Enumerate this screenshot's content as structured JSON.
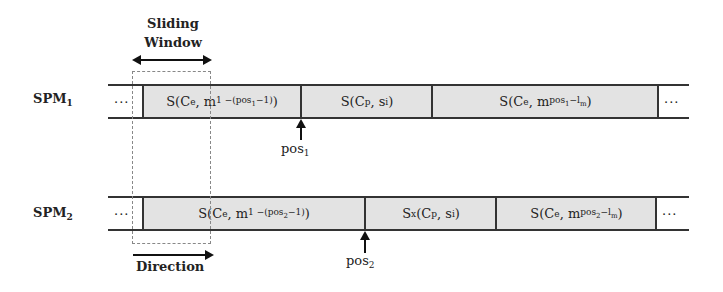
{
  "labels": {
    "sliding_window_line1": "Sliding",
    "sliding_window_line2": "Window",
    "direction": "Direction"
  },
  "rows": [
    {
      "name": "SPM",
      "index": "1",
      "leading_dots": "...",
      "trailing_dots": "...",
      "cells": [
        {
          "prefix": "S(C",
          "c_sub": "e",
          "mid": ", m",
          "m_sub_a": "1 −(pos",
          "m_sub_b": "1",
          "m_sub_c": "−1)",
          "suffix": ")"
        },
        {
          "prefix": "S(C",
          "c_sub": "p",
          "mid": ", s",
          "s_sub": "i",
          "suffix": ")"
        },
        {
          "prefix": "S(C",
          "c_sub": "e",
          "mid": ", m",
          "m_sub_a": "pos",
          "m_sub_b": "1",
          "m_sub_c": "−l",
          "m_sub_d": "m",
          "suffix": ")"
        }
      ],
      "pointer": {
        "label": "pos",
        "index": "1"
      }
    },
    {
      "name": "SPM",
      "index": "2",
      "leading_dots": "...",
      "trailing_dots": "...",
      "cells": [
        {
          "prefix": "S(C",
          "c_sub": "e",
          "mid": ", m",
          "m_sub_a": "1 −(pos",
          "m_sub_b": "2",
          "m_sub_c": "−1)",
          "suffix": ")"
        },
        {
          "prefix": "S",
          "s_sub_x": "x",
          "prefix2": " (C",
          "c_sub": "p",
          "mid": ", s",
          "s_sub": "i",
          "suffix": ")"
        },
        {
          "prefix": "S(C",
          "c_sub": "e",
          "mid": ", m",
          "m_sub_a": "pos",
          "m_sub_b": "2",
          "m_sub_c": "−l",
          "m_sub_d": "m",
          "suffix": ")"
        }
      ],
      "pointer": {
        "label": "pos",
        "index": "2"
      }
    }
  ],
  "colors": {
    "cell_fill": "#e3e3e3",
    "line": "#333333",
    "dashed_box": "#888888"
  }
}
